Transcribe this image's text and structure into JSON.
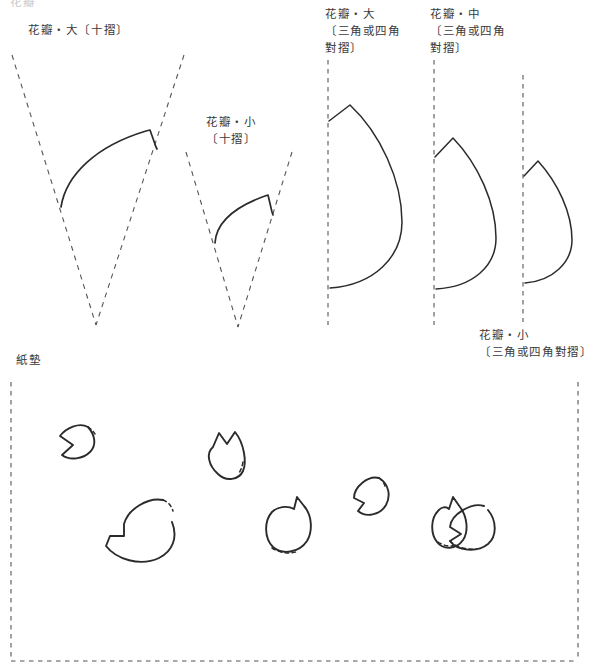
{
  "page": {
    "width": 605,
    "height": 666,
    "background": "#ffffff",
    "line_color": "#2b2b2b",
    "dashed_color": "#555555",
    "text_color": "#3a3a3a"
  },
  "labels": [
    {
      "name": "label-petal-large-ten-fold",
      "lines": [
        "花瓣・大〔十摺〕"
      ],
      "x": 28,
      "y": 22,
      "faint": false
    },
    {
      "name": "label-petal-small-ten-fold",
      "lines": [
        "花瓣・小",
        "〔十摺〕"
      ],
      "x": 206,
      "y": 114,
      "faint": false
    },
    {
      "name": "label-petal-large-tri-quad-fold",
      "lines": [
        "花瓣・大",
        "〔三角或四角",
        "對摺〕"
      ],
      "x": 325,
      "y": 6,
      "faint": false
    },
    {
      "name": "label-petal-medium-tri-quad-fold",
      "lines": [
        "花瓣・中",
        "〔三角或四角",
        "對摺〕"
      ],
      "x": 430,
      "y": 6,
      "faint": false
    },
    {
      "name": "label-petal-small-tri-quad-fold",
      "lines": [
        "花瓣・小",
        "〔三角或四角對摺〕"
      ],
      "x": 479,
      "y": 327,
      "faint": false
    },
    {
      "name": "label-paper-mat",
      "lines": [
        "紙墊"
      ],
      "x": 16,
      "y": 352,
      "faint": false
    },
    {
      "name": "label-top-cropped",
      "lines": [
        "花瓣"
      ],
      "x": 10,
      "y": -6,
      "faint": true
    }
  ],
  "figures": {
    "petal_large_ten_fold": {
      "name": "figure-petal-large-ten-fold",
      "fold_lines": [
        {
          "name": "fold-line-left",
          "x1": 12,
          "y1": 55,
          "x2": 96,
          "y2": 325
        },
        {
          "name": "fold-line-right",
          "x1": 184,
          "y1": 55,
          "x2": 96,
          "y2": 325
        }
      ],
      "cut_line": "M 61,207 C 66,175 96,146 146,131 L 150,130 L 156,147 L 157,149"
    },
    "petal_small_ten_fold": {
      "name": "figure-petal-small-ten-fold",
      "fold_lines": [
        {
          "name": "fold-line-left",
          "x1": 186,
          "y1": 152,
          "x2": 238,
          "y2": 327
        },
        {
          "name": "fold-line-right",
          "x1": 292,
          "y1": 152,
          "x2": 238,
          "y2": 327
        }
      ],
      "cut_line": "M 215,243 C 216,226 229,209 265,196 L 268,195 L 272,212 L 273,215"
    },
    "petal_large_tri_quad": {
      "name": "figure-petal-large-tri-quad",
      "fold_line": {
        "name": "fold-line-vertical",
        "x1": 328,
        "y1": 60,
        "x2": 328,
        "y2": 325
      },
      "cut_line": "M 329,121 L 350,105 C 380,133 402,180 402,222 C 402,257 374,285 330,288"
    },
    "petal_medium_tri_quad": {
      "name": "figure-petal-medium-tri-quad",
      "fold_line": {
        "name": "fold-line-vertical",
        "x1": 434,
        "y1": 60,
        "x2": 434,
        "y2": 325
      },
      "cut_line": "M 435,157 L 453,138 C 478,164 496,203 496,238 C 496,266 473,287 436,289"
    },
    "petal_small_tri_quad": {
      "name": "figure-petal-small-tri-quad",
      "fold_line": {
        "name": "fold-line-vertical",
        "x1": 523,
        "y1": 75,
        "x2": 523,
        "y2": 322
      },
      "cut_line": "M 524,176 L 538,161 C 558,183 572,213 572,240 C 572,262 553,281 525,283"
    },
    "paper_mat": {
      "name": "figure-paper-mat",
      "border": {
        "left": 11,
        "top": 382,
        "right": 578,
        "bottom": 661
      },
      "petals": [
        {
          "name": "mat-petal-1",
          "solid": "M 88,427 C 95,435 97,445 90,452 C 83,459 70,461 62,455 L 73,445 L 60,436 C 66,428 79,422 88,427",
          "dashed": "M 88,427 C 91,429 93,431 95,434"
        },
        {
          "name": "mat-petal-2",
          "solid": "M 213,447 L 219,433 L 227,444 L 235,432 C 244,443 247,462 243,471 C 239,480 226,482 218,474 C 208,465 206,453 213,447",
          "dashed": "M 243,462 C 242,467 241,470 239,473"
        },
        {
          "name": "mat-petal-3",
          "solid": "M 172,522 C 178,537 173,551 159,558 C 140,567 116,559 106,546 L 110,536 L 124,536 L 124,524 C 128,509 148,497 163,500",
          "dashed": "M 163,500 C 168,502 171,505 173,511"
        },
        {
          "name": "mat-petal-4",
          "solid": "M 294,509 L 297,497 L 304,506 C 312,515 313,531 307,541 C 299,553 282,555 273,547 C 264,538 264,521 272,512 C 277,507 287,505 294,509",
          "dashed": "M 272,548 C 280,553 288,554 296,552"
        },
        {
          "name": "mat-petal-5",
          "solid": "M 379,478 C 389,484 391,496 386,505 C 380,515 366,518 358,511 L 364,503 L 354,498 C 354,487 368,475 379,478",
          "dashed": "M 379,478 C 382,480 384,483 385,486"
        },
        {
          "name": "mat-petal-6",
          "solid": "M 449,509 L 453,497 L 460,507 C 467,516 469,531 463,540 C 456,550 443,550 437,542 C 430,533 431,518 438,511 C 441,507 446,506 449,509",
          "dashed": "M 438,542 C 444,546 450,547 456,545"
        },
        {
          "name": "mat-petal-7",
          "solid": "M 488,510 C 497,521 497,536 488,544 C 477,553 457,551 450,541 L 461,534 L 450,527 C 451,514 472,502 484,506",
          "dashed": "M 450,541 C 456,547 466,550 476,549"
        }
      ]
    }
  }
}
